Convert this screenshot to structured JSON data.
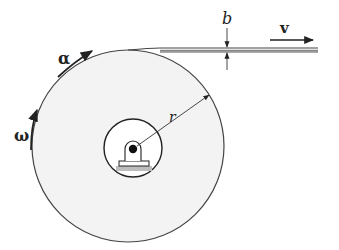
{
  "diagram": {
    "type": "physics-figure",
    "labels": {
      "thickness": "b",
      "velocity": "v",
      "radius": "r",
      "angular_acceleration": "α",
      "angular_velocity": "ω"
    },
    "colors": {
      "line": "#444444",
      "reel_fill": "#f3f3f3",
      "hub_fill": "#ffffff",
      "ground_hatch": "#bdbdbd",
      "axle": "#111111"
    }
  }
}
